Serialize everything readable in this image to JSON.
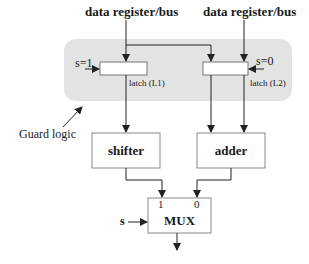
{
  "diagram": {
    "inputs": [
      {
        "label": "data register/bus"
      },
      {
        "label": "data register/bus"
      }
    ],
    "guard": {
      "label": "Guard logic",
      "fill": "#e3e3e3"
    },
    "latches": [
      {
        "label": "latch (L1)",
        "select": "s=1"
      },
      {
        "label": "latch (L2)",
        "select": "s=0"
      }
    ],
    "units": [
      {
        "label": "shifter"
      },
      {
        "label": "adder"
      }
    ],
    "mux": {
      "label": "MUX",
      "input1": "1",
      "input0": "0",
      "select": "s"
    },
    "colors": {
      "line": "#333333",
      "box_border": "#888888"
    }
  }
}
